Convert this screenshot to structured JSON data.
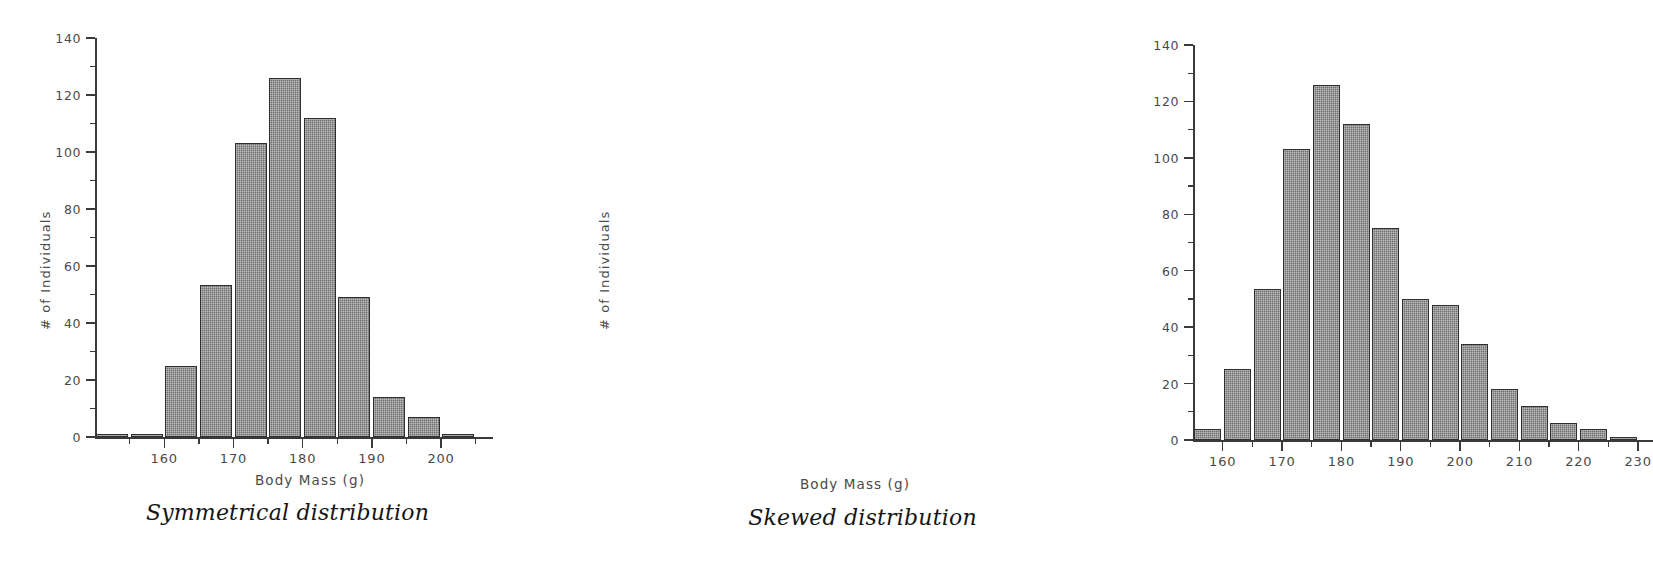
{
  "figure": {
    "background": "#ffffff",
    "bar_color": "#6f6f6f",
    "bar_border_color": "#2f2f2f",
    "axis_color": "#3a3a3a",
    "text_color": "#4a4a4a"
  },
  "panels": [
    {
      "id": "symmetrical",
      "caption": "Symmetrical distribution",
      "xlabel": "Body Mass (g)",
      "ylabel": "# of Individuals"
    },
    {
      "id": "skewed",
      "caption": "Skewed distribution",
      "xlabel": "Body Mass (g)",
      "ylabel": "# of Individuals"
    }
  ],
  "chart_data": [
    {
      "type": "bar",
      "title": "Symmetrical distribution",
      "xlabel": "Body Mass (g)",
      "ylabel": "# of Individuals",
      "bin_width": 5,
      "categories": [
        "152.5",
        "157.5",
        "162.5",
        "167.5",
        "172.5",
        "177.5",
        "182.5",
        "187.5",
        "192.5",
        "197.5",
        "202.5"
      ],
      "bin_starts": [
        150,
        155,
        160,
        165,
        170,
        175,
        180,
        185,
        190,
        195,
        200
      ],
      "values": [
        1,
        1,
        25,
        53.5,
        103,
        126,
        112,
        49,
        14,
        7,
        0.5
      ],
      "xlim": [
        150,
        207.5
      ],
      "ylim": [
        0,
        140
      ],
      "x_major_ticks": [
        160,
        170,
        180,
        190,
        200
      ],
      "x_minor_ticks": [
        155,
        165,
        175,
        185,
        195,
        205
      ],
      "x_tick_labels": [
        "160",
        "170",
        "180",
        "190",
        "200"
      ],
      "y_major_ticks": [
        0,
        20,
        40,
        60,
        80,
        100,
        120,
        140
      ],
      "y_minor_ticks": [
        10,
        30,
        50,
        70,
        90,
        110,
        130
      ],
      "y_tick_labels": [
        "0",
        "20",
        "40",
        "60",
        "80",
        "100",
        "120",
        "140"
      ],
      "grid": false,
      "legend": "none"
    },
    {
      "type": "bar",
      "title": "Skewed distribution",
      "xlabel": "Body Mass (g)",
      "ylabel": "# of Individuals",
      "bin_width": 5,
      "categories": [
        "157.5",
        "162.5",
        "167.5",
        "172.5",
        "177.5",
        "182.5",
        "187.5",
        "192.5",
        "197.5",
        "202.5",
        "207.5",
        "212.5",
        "217.5",
        "222.5",
        "227.5"
      ],
      "bin_starts": [
        155,
        160,
        165,
        170,
        175,
        180,
        185,
        190,
        195,
        200,
        205,
        210,
        215,
        220,
        225
      ],
      "values": [
        4,
        25,
        53.5,
        103,
        126,
        112,
        75,
        50,
        48,
        34,
        18,
        12,
        6,
        4,
        1
      ],
      "xlim": [
        155,
        232.5
      ],
      "ylim": [
        0,
        140
      ],
      "x_major_ticks": [
        160,
        170,
        180,
        190,
        200,
        210,
        220,
        230
      ],
      "x_minor_ticks": [
        165,
        175,
        185,
        195,
        205,
        215,
        225
      ],
      "x_tick_labels": [
        "160",
        "170",
        "180",
        "190",
        "200",
        "210",
        "220",
        "230"
      ],
      "y_major_ticks": [
        0,
        20,
        40,
        60,
        80,
        100,
        120,
        140
      ],
      "y_minor_ticks": [
        10,
        30,
        50,
        70,
        90,
        110,
        130
      ],
      "y_tick_labels": [
        "0",
        "20",
        "40",
        "60",
        "80",
        "100",
        "120",
        "140"
      ],
      "grid": false,
      "legend": "none"
    }
  ]
}
